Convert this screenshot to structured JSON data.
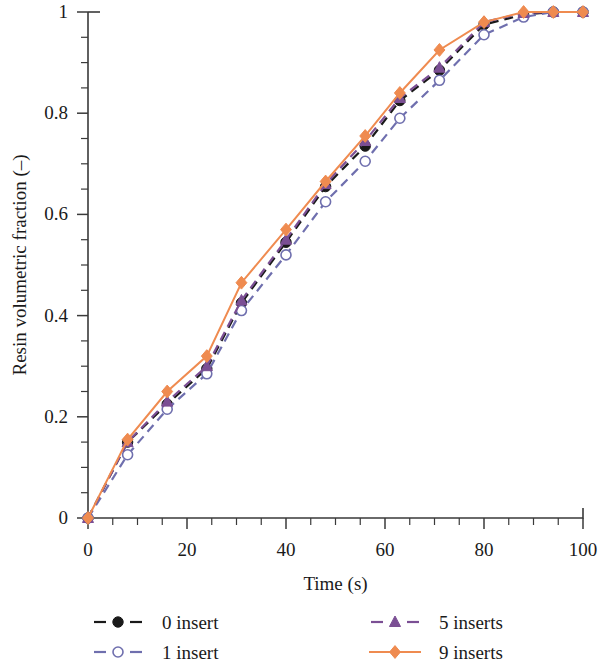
{
  "chart_data": {
    "type": "line",
    "title": "",
    "xlabel": "Time (s)",
    "ylabel": "Resin volumetric fraction (–)",
    "xlim": [
      0,
      100
    ],
    "ylim": [
      0,
      1
    ],
    "xticks": [
      0,
      20,
      40,
      60,
      80,
      100
    ],
    "xticklabels": [
      "0",
      "20",
      "40",
      "60",
      "80",
      "100"
    ],
    "yticks": [
      0,
      0.2,
      0.4,
      0.6,
      0.8,
      1
    ],
    "yticklabels": [
      "0",
      "0.2",
      "0.4",
      "0.6",
      "0.8",
      "1"
    ],
    "x_minor_step": 5,
    "y_minor_step": 0.05,
    "grid": false,
    "legend_position": "below-axes",
    "legend_columns": 2,
    "series": [
      {
        "name": "0 insert",
        "color": "#1a1a1a",
        "marker": "circle-filled",
        "linestyle": "dashed",
        "x": [
          0,
          8,
          16,
          24,
          31,
          40,
          48,
          56,
          63,
          71,
          80,
          88,
          94,
          100
        ],
        "y": [
          0,
          0.15,
          0.225,
          0.295,
          0.425,
          0.545,
          0.655,
          0.735,
          0.825,
          0.885,
          0.975,
          0.995,
          1.0,
          1.0
        ]
      },
      {
        "name": "1 insert",
        "color": "#6f6fae",
        "marker": "circle-open",
        "linestyle": "dashed",
        "x": [
          0,
          8,
          16,
          24,
          31,
          40,
          48,
          56,
          63,
          71,
          80,
          88,
          94,
          100
        ],
        "y": [
          0,
          0.125,
          0.215,
          0.285,
          0.41,
          0.52,
          0.625,
          0.705,
          0.79,
          0.865,
          0.955,
          0.99,
          1.0,
          1.0
        ]
      },
      {
        "name": "5 inserts",
        "color": "#7b4f94",
        "marker": "triangle",
        "linestyle": "dashed",
        "x": [
          0,
          8,
          16,
          24,
          31,
          40,
          48,
          56,
          63,
          71,
          80,
          88,
          94,
          100
        ],
        "y": [
          0,
          0.15,
          0.23,
          0.3,
          0.43,
          0.55,
          0.66,
          0.745,
          0.83,
          0.89,
          0.98,
          0.998,
          1.0,
          1.0
        ]
      },
      {
        "name": "9 inserts",
        "color": "#ef8b50",
        "marker": "diamond",
        "linestyle": "solid",
        "x": [
          0,
          8,
          16,
          24,
          31,
          40,
          48,
          56,
          63,
          71,
          80,
          88,
          94,
          100
        ],
        "y": [
          0,
          0.155,
          0.25,
          0.32,
          0.465,
          0.57,
          0.665,
          0.755,
          0.84,
          0.925,
          0.98,
          1.0,
          1.0,
          1.0
        ]
      }
    ]
  },
  "legend": {
    "entries": [
      {
        "label": "0 insert",
        "color": "#1a1a1a",
        "marker": "circle-filled",
        "linestyle": "dashed"
      },
      {
        "label": "5 inserts",
        "color": "#7b4f94",
        "marker": "triangle",
        "linestyle": "dashed"
      },
      {
        "label": "1 insert",
        "color": "#6f6fae",
        "marker": "circle-open",
        "linestyle": "dashed"
      },
      {
        "label": "9 inserts",
        "color": "#ef8b50",
        "marker": "diamond",
        "linestyle": "solid"
      }
    ]
  },
  "colors": {
    "axis": "#3a3a3a",
    "text": "#1a1a1a",
    "background": "#ffffff",
    "series_0_insert": "#1a1a1a",
    "series_1_insert": "#6f6fae",
    "series_5_inserts": "#7b4f94",
    "series_9_inserts": "#ef8b50"
  }
}
